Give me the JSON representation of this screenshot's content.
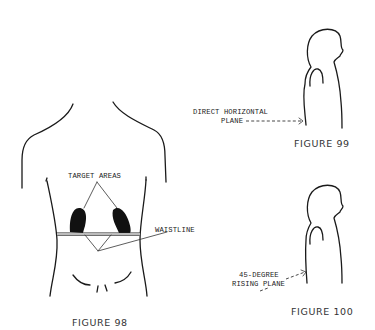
{
  "figures": [
    {
      "id": "figure-98",
      "caption": "FIGURE 98",
      "labels": {
        "target_areas": "TARGET AREAS",
        "waistline": "WAISTLINE"
      },
      "ink_color": "#1a1a1a",
      "target_fill": "#111111"
    },
    {
      "id": "figure-99",
      "caption": "FIGURE 99",
      "labels": {
        "plane_line1": "DIRECT HORIZONTAL",
        "plane_line2": "PLANE"
      }
    },
    {
      "id": "figure-100",
      "caption": "FIGURE 100",
      "labels": {
        "plane_line1": "45-DEGREE",
        "plane_line2": "RISING PLANE"
      }
    }
  ]
}
